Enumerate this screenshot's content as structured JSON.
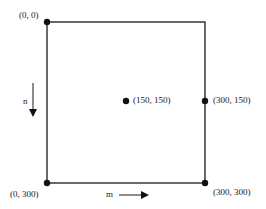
{
  "diagram": {
    "colors": {
      "stroke": "#1a1a1a",
      "background": "#ffffff"
    },
    "square": {
      "x0": 47,
      "y0": 22,
      "x1": 205,
      "y1": 183
    },
    "points": [
      {
        "id": "top-left",
        "label": "(0, 0)",
        "x": 47,
        "y": 22,
        "dot": true
      },
      {
        "id": "center",
        "label": "(150, 150)",
        "x": 126,
        "y": 101,
        "dot": true
      },
      {
        "id": "right-mid",
        "label": "(300, 150)",
        "x": 205,
        "y": 101,
        "dot": true
      },
      {
        "id": "bottom-left",
        "label": "(0, 300)",
        "x": 47,
        "y": 183,
        "dot": true
      },
      {
        "id": "bottom-right",
        "label": "(300, 300)",
        "x": 205,
        "y": 183,
        "dot": true
      }
    ],
    "axes": {
      "n": {
        "label": "n",
        "direction": "down"
      },
      "m": {
        "label": "m",
        "direction": "right"
      }
    }
  }
}
